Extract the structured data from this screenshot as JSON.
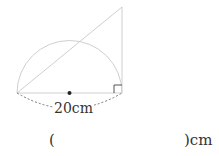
{
  "figure": {
    "dimension_label": "20cm",
    "shapes": [
      "semicircle",
      "right-triangle",
      "center-point",
      "right-angle-marker",
      "dashed-dimension-arc"
    ],
    "colors": {
      "line": "#c8c8c8",
      "dashed": "#777777",
      "dot": "#222222",
      "text": "#333333"
    }
  },
  "answer": {
    "open_paren": "(",
    "close_paren_unit": ")cm"
  }
}
